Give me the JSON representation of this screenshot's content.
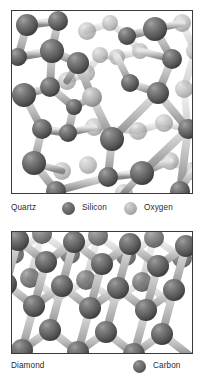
{
  "figure": {
    "kind": "crystal-structure-comparison",
    "background_color": "#ffffff",
    "panel_border_color": "#3a3a3a",
    "text_color": "#2b2b2b"
  },
  "panels": [
    {
      "id": "quartz",
      "caption": "Quartz",
      "structure": "irregular tetrahedral silicon-oxygen framework with a large open ring channel",
      "legend": [
        {
          "label": "Silicon",
          "swatch": "sphere-dark-gray",
          "color": "#6a6a6a"
        },
        {
          "label": "Oxygen",
          "swatch": "sphere-light-gray",
          "color": "#b0b0b0"
        }
      ]
    },
    {
      "id": "diamond",
      "caption": "Diamond",
      "structure": "regular repeating tetrahedral carbon lattice",
      "legend": [
        {
          "label": "Carbon",
          "swatch": "sphere-dark-gray",
          "color": "#6a6a6a"
        }
      ]
    }
  ],
  "legend_rows": {
    "quartz": {
      "name": "Quartz",
      "item1_label": "Silicon",
      "item2_label": "Oxygen"
    },
    "diamond": {
      "name": "Diamond",
      "item1_label": "Carbon"
    }
  },
  "bond_color": "#c0c0c0",
  "atom_colors": {
    "silicon": "#6a6a6a",
    "oxygen": "#b0b0b0",
    "carbon": "#6a6a6a"
  },
  "scene_quartz": {
    "atoms": [
      {
        "x": 15,
        "y": 14,
        "r": 11,
        "kind": "dark",
        "depth": "near"
      },
      {
        "x": 46,
        "y": 10,
        "r": 10,
        "kind": "dark",
        "depth": "near"
      },
      {
        "x": 75,
        "y": 20,
        "r": 9,
        "kind": "light",
        "depth": "far"
      },
      {
        "x": 98,
        "y": 12,
        "r": 8,
        "kind": "light",
        "depth": "far"
      },
      {
        "x": 115,
        "y": 25,
        "r": 9,
        "kind": "dark",
        "depth": "mid"
      },
      {
        "x": 143,
        "y": 18,
        "r": 12,
        "kind": "dark",
        "depth": "near"
      },
      {
        "x": 170,
        "y": 12,
        "r": 9,
        "kind": "light",
        "depth": "far"
      },
      {
        "x": 6,
        "y": 46,
        "r": 9,
        "kind": "dark",
        "depth": "mid"
      },
      {
        "x": 40,
        "y": 40,
        "r": 12,
        "kind": "dark",
        "depth": "near"
      },
      {
        "x": 66,
        "y": 52,
        "r": 11,
        "kind": "dark",
        "depth": "near"
      },
      {
        "x": 88,
        "y": 44,
        "r": 8,
        "kind": "light",
        "depth": "far"
      },
      {
        "x": 105,
        "y": 46,
        "r": 8,
        "kind": "light",
        "depth": "far"
      },
      {
        "x": 128,
        "y": 40,
        "r": 8,
        "kind": "light",
        "depth": "far"
      },
      {
        "x": 160,
        "y": 48,
        "r": 10,
        "kind": "dark",
        "depth": "mid"
      },
      {
        "x": 183,
        "y": 40,
        "r": 9,
        "kind": "light",
        "depth": "far"
      },
      {
        "x": 12,
        "y": 84,
        "r": 12,
        "kind": "dark",
        "depth": "near"
      },
      {
        "x": 38,
        "y": 76,
        "r": 10,
        "kind": "dark",
        "depth": "mid"
      },
      {
        "x": 55,
        "y": 70,
        "r": 9,
        "kind": "light",
        "depth": "far"
      },
      {
        "x": 74,
        "y": 62,
        "r": 9,
        "kind": "light",
        "depth": "far"
      },
      {
        "x": 80,
        "y": 86,
        "r": 10,
        "kind": "light",
        "depth": "mid"
      },
      {
        "x": 62,
        "y": 96,
        "r": 8,
        "kind": "dark",
        "depth": "mid"
      },
      {
        "x": 118,
        "y": 72,
        "r": 9,
        "kind": "dark",
        "depth": "mid"
      },
      {
        "x": 146,
        "y": 82,
        "r": 11,
        "kind": "dark",
        "depth": "near"
      },
      {
        "x": 172,
        "y": 78,
        "r": 9,
        "kind": "light",
        "depth": "far"
      },
      {
        "x": 30,
        "y": 118,
        "r": 10,
        "kind": "dark",
        "depth": "mid"
      },
      {
        "x": 56,
        "y": 122,
        "r": 9,
        "kind": "dark",
        "depth": "mid"
      },
      {
        "x": 82,
        "y": 116,
        "r": 9,
        "kind": "light",
        "depth": "far"
      },
      {
        "x": 100,
        "y": 128,
        "r": 12,
        "kind": "dark",
        "depth": "near"
      },
      {
        "x": 126,
        "y": 120,
        "r": 9,
        "kind": "light",
        "depth": "far"
      },
      {
        "x": 152,
        "y": 112,
        "r": 9,
        "kind": "light",
        "depth": "far"
      },
      {
        "x": 176,
        "y": 118,
        "r": 10,
        "kind": "dark",
        "depth": "mid"
      },
      {
        "x": 22,
        "y": 152,
        "r": 12,
        "kind": "dark",
        "depth": "near"
      },
      {
        "x": 50,
        "y": 160,
        "r": 9,
        "kind": "light",
        "depth": "far"
      },
      {
        "x": 76,
        "y": 154,
        "r": 9,
        "kind": "light",
        "depth": "far"
      },
      {
        "x": 96,
        "y": 166,
        "r": 10,
        "kind": "dark",
        "depth": "mid"
      },
      {
        "x": 130,
        "y": 162,
        "r": 12,
        "kind": "dark",
        "depth": "near"
      },
      {
        "x": 158,
        "y": 150,
        "r": 9,
        "kind": "light",
        "depth": "far"
      },
      {
        "x": 180,
        "y": 160,
        "r": 9,
        "kind": "light",
        "depth": "far"
      },
      {
        "x": 44,
        "y": 180,
        "r": 10,
        "kind": "dark",
        "depth": "mid"
      },
      {
        "x": 112,
        "y": 182,
        "r": 9,
        "kind": "light",
        "depth": "far"
      },
      {
        "x": 168,
        "y": 180,
        "r": 10,
        "kind": "dark",
        "depth": "mid"
      }
    ]
  },
  "scene_diamond": {
    "lattice": "face-centred cubic, viewed along an oblique axis",
    "rows": 4,
    "columns": 5,
    "atom_radius": 11,
    "atom_kind": "dark"
  }
}
